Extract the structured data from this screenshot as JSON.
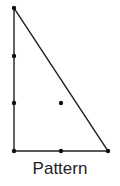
{
  "diagram": {
    "caption": "Pattern",
    "triangle": {
      "vertices": [
        [
          14,
          8
        ],
        [
          14,
          151
        ],
        [
          108,
          151
        ]
      ],
      "stroke": "#222222"
    },
    "dots": [
      [
        14,
        8
      ],
      [
        14,
        56
      ],
      [
        14,
        103
      ],
      [
        14,
        151
      ],
      [
        61,
        103
      ],
      [
        61,
        151
      ],
      [
        108,
        151
      ]
    ],
    "dot_color": "#111111"
  }
}
